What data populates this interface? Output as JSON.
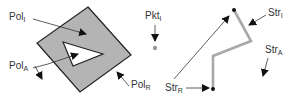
{
  "colors": {
    "polygon_fill": "#b4b4b4",
    "stroke": "#222222",
    "line_gray": "#a8a8a8",
    "point": "#999999",
    "text": "#333333"
  },
  "labels": {
    "pol_i": {
      "base": "Pol",
      "sub": "I"
    },
    "pol_a": {
      "base": "Pol",
      "sub": "A"
    },
    "pol_r": {
      "base": "Pol",
      "sub": "R"
    },
    "pkt_i": {
      "base": "Pkt",
      "sub": "I"
    },
    "str_i": {
      "base": "Str",
      "sub": "I"
    },
    "str_a": {
      "base": "Str",
      "sub": "A"
    },
    "str_r": {
      "base": "Str",
      "sub": "R"
    }
  }
}
